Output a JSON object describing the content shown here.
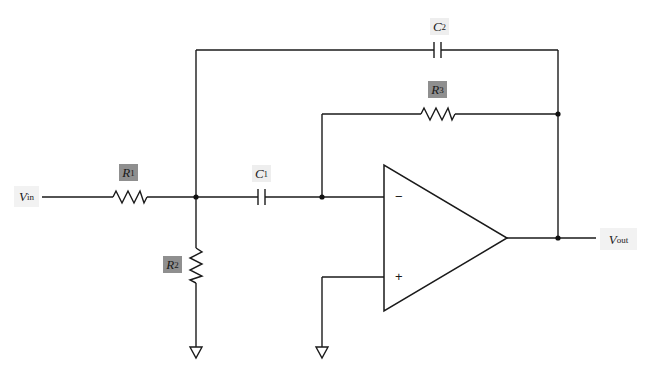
{
  "diagram": {
    "title": "",
    "type": "op-amp active filter schematic",
    "colors": {
      "wire": "#1a1a1a",
      "resistor_label_bg": "#8f8f8f",
      "capacitor_label_bg": "#eeeeee",
      "port_label_bg": "#f2f2f2",
      "background": "#ffffff"
    },
    "ports": {
      "input": {
        "symbol": "V",
        "sub": "in"
      },
      "output": {
        "symbol": "V",
        "sub": "out"
      }
    },
    "components": {
      "R1": {
        "symbol": "R",
        "sub": "1",
        "kind": "resistor"
      },
      "R2": {
        "symbol": "R",
        "sub": "2",
        "kind": "resistor"
      },
      "R3": {
        "symbol": "R",
        "sub": "3",
        "kind": "resistor"
      },
      "C1": {
        "symbol": "C",
        "sub": "1",
        "kind": "capacitor"
      },
      "C2": {
        "symbol": "C",
        "sub": "2",
        "kind": "capacitor"
      }
    },
    "opamp": {
      "inverting_sign": "−",
      "noninverting_sign": "+"
    },
    "grounds": [
      "R2 to ground",
      "non-inverting input to ground"
    ]
  }
}
